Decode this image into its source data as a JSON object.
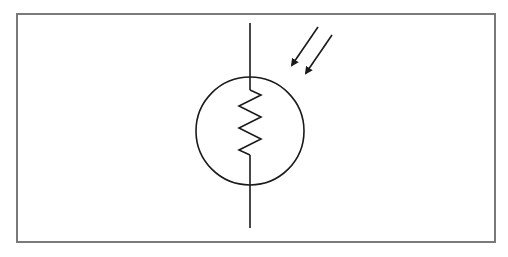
{
  "diagram": {
    "symbol": "photoresistor-ldr",
    "colors": {
      "stroke": "#1a1a1a",
      "frame": "#7a7a7a",
      "background": "#ffffff"
    },
    "elements": {
      "lead_line": {
        "x": 250,
        "y_top": 23,
        "y_bottom": 228
      },
      "circle": {
        "cx": 250,
        "cy": 131,
        "r": 54
      },
      "resistor_zigzag": {
        "y_start": 90,
        "y_end": 155,
        "peaks": 3
      },
      "light_arrows": [
        {
          "from": [
            318,
            27
          ],
          "to": [
            290,
            68
          ]
        },
        {
          "from": [
            332,
            35
          ],
          "to": [
            304,
            76
          ]
        }
      ]
    }
  }
}
